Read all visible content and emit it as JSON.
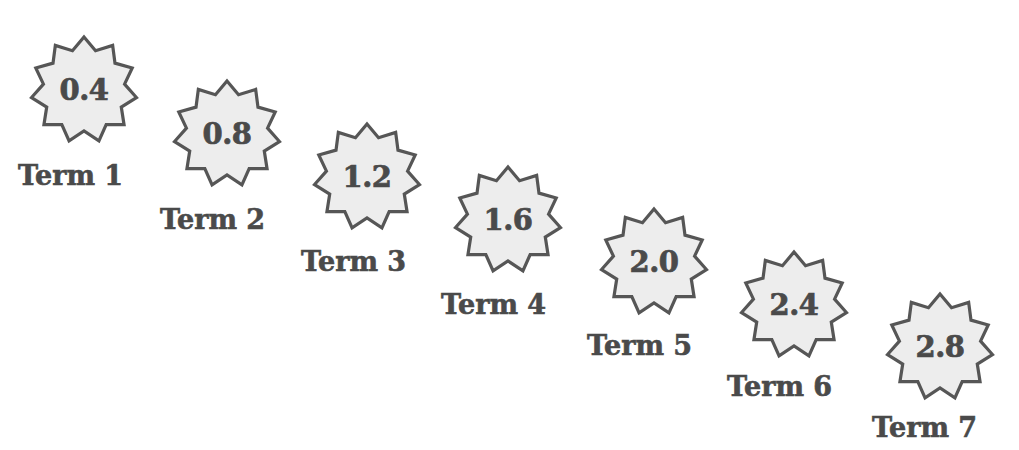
{
  "figure": {
    "background_color": "#ffffff",
    "badge_fill_color": "#ededed",
    "badge_stroke_color": "#565656",
    "text_color": "#4a4a4a",
    "badge_shape": "starburst-11-point",
    "layout": "descending-staircase-left-to-right"
  },
  "chart_data": {
    "type": "table",
    "title": "",
    "subtitle": "",
    "xlabel": "",
    "ylabel": "",
    "categories": [
      "Term 1",
      "Term 2",
      "Term 3",
      "Term 4",
      "Term 5",
      "Term 6",
      "Term 7"
    ],
    "values": [
      0.4,
      0.8,
      1.2,
      1.6,
      2.0,
      2.4,
      2.8
    ],
    "value_labels": [
      "0.4",
      "0.8",
      "1.2",
      "1.6",
      "2.0",
      "2.4",
      "2.8"
    ],
    "common_difference": 0.4,
    "grid": false,
    "legend": "none"
  },
  "terms": [
    {
      "label": "Term 1",
      "value": "0.4",
      "star_left": 28,
      "star_top": 34,
      "label_left": 18,
      "label_top": 160
    },
    {
      "label": "Term 2",
      "value": "0.8",
      "star_left": 171,
      "star_top": 78,
      "label_left": 160,
      "label_top": 204
    },
    {
      "label": "Term 3",
      "value": "1.2",
      "star_left": 311,
      "star_top": 121,
      "label_left": 301,
      "label_top": 246
    },
    {
      "label": "Term 4",
      "value": "1.6",
      "star_left": 452,
      "star_top": 164,
      "label_left": 441,
      "label_top": 289
    },
    {
      "label": "Term 5",
      "value": "2.0",
      "star_left": 598,
      "star_top": 206,
      "label_left": 587,
      "label_top": 330
    },
    {
      "label": "Term 6",
      "value": "2.4",
      "star_left": 738,
      "star_top": 249,
      "label_left": 727,
      "label_top": 371
    },
    {
      "label": "Term 7",
      "value": "2.8",
      "star_left": 884,
      "star_top": 291,
      "label_left": 872,
      "label_top": 412
    }
  ]
}
